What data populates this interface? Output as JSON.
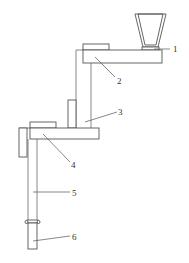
{
  "figure": {
    "type": "mechanical-schematic",
    "top_cutoff_text": [
      "",
      ""
    ]
  },
  "callouts": [
    {
      "id": "1",
      "label": "1",
      "target": "hopper-outlet"
    },
    {
      "id": "2",
      "label": "2",
      "target": "upper-arm"
    },
    {
      "id": "3",
      "label": "3",
      "target": "vertical-column"
    },
    {
      "id": "4",
      "label": "4",
      "target": "lower-arm"
    },
    {
      "id": "5",
      "label": "5",
      "target": "upper-rod"
    },
    {
      "id": "6",
      "label": "6",
      "target": "lower-rod"
    }
  ],
  "colors": {
    "line": "#555555",
    "background": "#ffffff",
    "text": "#333333"
  }
}
